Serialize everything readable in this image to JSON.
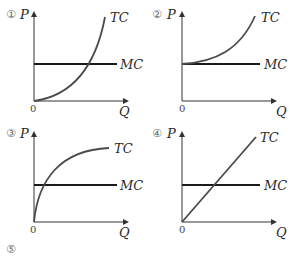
{
  "panels": [
    {
      "number": "①",
      "y_axis": "P",
      "x_axis": "Q",
      "origin": "0",
      "curve1": "TC",
      "curve2": "MC",
      "tc_shape": "convex-from-origin"
    },
    {
      "number": "②",
      "y_axis": "P",
      "x_axis": "Q",
      "origin": "0",
      "curve1": "TC",
      "curve2": "MC",
      "tc_shape": "convex-from-mc-intercept"
    },
    {
      "number": "③",
      "y_axis": "P",
      "x_axis": "Q",
      "origin": "0",
      "curve1": "TC",
      "curve2": "MC",
      "tc_shape": "concave-from-origin"
    },
    {
      "number": "④",
      "y_axis": "P",
      "x_axis": "Q",
      "origin": "0",
      "curve1": "TC",
      "curve2": "MC",
      "tc_shape": "linear-from-origin"
    }
  ],
  "option5": {
    "number": "⑤"
  },
  "colors": {
    "tc": "#4a4a4a",
    "mc": "#1a1a1a",
    "axis": "#333333"
  }
}
